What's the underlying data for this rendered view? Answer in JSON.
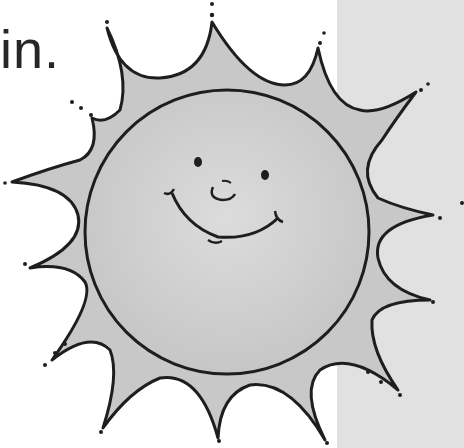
{
  "caption": {
    "text": "in."
  },
  "illustration": {
    "subject": "smiling-sun",
    "colors": {
      "background": "#ffffff",
      "side_panel": "#e1e1e1",
      "sun_fill": "#c8c8c8",
      "sun_face_highlight": "#dcdcdc",
      "outline": "#1e1e1e",
      "text": "#262626"
    },
    "ray_count": 14
  }
}
